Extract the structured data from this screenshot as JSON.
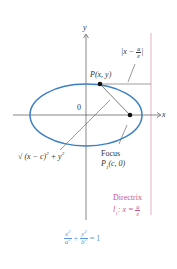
{
  "diagram": {
    "axes": {
      "x_label": "x",
      "y_label": "y",
      "origin_label": "0"
    },
    "point": {
      "label_prefix": "P",
      "label_args": "(x, y)"
    },
    "distance_to_directrix": {
      "left": "|x −",
      "num": "a",
      "den": "e",
      "right": "|"
    },
    "distance_to_focus": {
      "text": "√ (x − c)",
      "exp1": "2",
      "plus": " + y",
      "exp2": "2"
    },
    "focus": {
      "title": "Focus",
      "label_prefix": "P",
      "label_sub": "1",
      "label_args": "(c, 0)"
    },
    "directrix": {
      "title": "Directrix",
      "label_prefix": "l",
      "label_sub": "1",
      "label_eq": ": x =",
      "num": "a",
      "den": "e"
    },
    "equation": {
      "t1_num": "x",
      "t1_num_exp": "2",
      "t1_den": "a",
      "t1_den_exp": "2",
      "plus": "+",
      "t2_num": "y",
      "t2_num_exp": "2",
      "t2_den": "b",
      "t2_den_exp": "2",
      "rhs": "= 1"
    },
    "colors": {
      "ellipse": "#3b7fc4",
      "axes": "#555555",
      "directrix": "#e3a6bf",
      "directrix_text": "#d0508a",
      "equation_text": "#5a9bd0"
    }
  }
}
